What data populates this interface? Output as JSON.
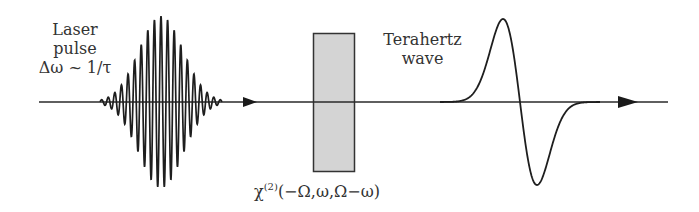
{
  "diagram": {
    "laser_label": {
      "line1": "Laser",
      "line2": "pulse",
      "line3": "Δω ~ 1/τ"
    },
    "thz_label": {
      "line1": "Terahertz",
      "line2": "wave"
    },
    "crystal_label": {
      "symbol": "χ",
      "superscript": "(2)",
      "arguments": "(−Ω,ω,Ω−ω)"
    },
    "colors": {
      "line": "#2a2a2a",
      "crystal_fill": "#d4d4d4",
      "crystal_stroke": "#333333",
      "text": "#333333"
    },
    "components": [
      {
        "id": "laser-pulse",
        "type": "gaussian-wavepacket"
      },
      {
        "id": "crystal",
        "type": "nonlinear-crystal"
      },
      {
        "id": "thz-wave",
        "type": "single-cycle-pulse"
      }
    ]
  }
}
